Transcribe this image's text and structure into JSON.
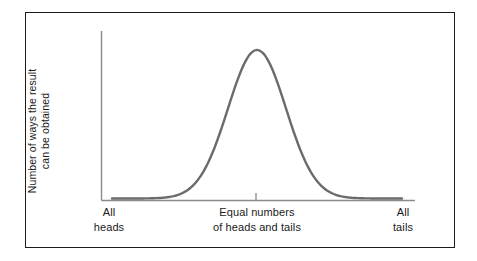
{
  "figure": {
    "frame_color": "#1c1c1c",
    "background": "#ffffff",
    "curve_color": "#6b6b6b",
    "axis_color": "#8a8a8a",
    "text_color": "#1a1a1a"
  },
  "axes": {
    "y_title_line1": "Number of ways the result",
    "y_title_line2": "can be obtained",
    "x_left_line1": "All",
    "x_left_line2": "heads",
    "x_center_line1": "Equal numbers",
    "x_center_line2": "of heads and tails",
    "x_right_line1": "All",
    "x_right_line2": "tails"
  },
  "chart_data": {
    "type": "line",
    "title": "",
    "subtitle": "",
    "xlabel": "",
    "ylabel": "Number of ways the result can be obtained",
    "xlim": [
      0,
      1
    ],
    "ylim": [
      0,
      1
    ],
    "grid": false,
    "legend": "none",
    "annotations": [
      "All heads",
      "Equal numbers of heads and tails",
      "All tails"
    ],
    "xtick_labels": [
      "All heads",
      "Equal numbers of heads and tails",
      "All tails"
    ],
    "xtick_positions": [
      0.0,
      0.5,
      1.0
    ],
    "ytick_labels": [],
    "series": [
      {
        "name": "Number of ways the result can be obtained",
        "mean": 0.5,
        "sigma": 0.1613,
        "peak_value": 1.0,
        "x": [
          0.0,
          0.035,
          0.07,
          0.105,
          0.14,
          0.175,
          0.21,
          0.245,
          0.28,
          0.315,
          0.35,
          0.385,
          0.42,
          0.455,
          0.5,
          0.545,
          0.58,
          0.615,
          0.65,
          0.685,
          0.72,
          0.755,
          0.79,
          0.825,
          0.86,
          0.895,
          0.93,
          0.965,
          1.0
        ],
        "values": [
          0.01,
          0.014,
          0.021,
          0.03,
          0.042,
          0.059,
          0.081,
          0.11,
          0.147,
          0.194,
          0.251,
          0.32,
          0.4,
          0.489,
          0.583,
          0.678,
          0.768,
          0.848,
          0.914,
          0.963,
          0.992,
          1.0,
          0.988,
          0.957,
          0.909,
          0.846,
          0.772,
          0.69,
          0.604
        ]
      }
    ]
  }
}
